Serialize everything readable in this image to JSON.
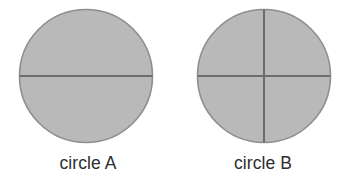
{
  "figure": {
    "name": "two-shaded-circles-partitioned",
    "background_color": "#ffffff",
    "width": 351,
    "height": 185
  },
  "colors": {
    "circle_fill": "#b9b9b9",
    "circle_stroke": "#8e8e8e",
    "divider_line": "#6d6d6d",
    "label_text": "#2e2e2e"
  },
  "shapes": [
    {
      "id": "circle-a",
      "label": "circle A",
      "center_x": 86,
      "center_y": 76,
      "radius": 67,
      "fill": "#b9b9b9",
      "stroke": "#8e8e8e",
      "partitions": 2,
      "dividers": [
        "horizontal"
      ],
      "shaded_parts": 2
    },
    {
      "id": "circle-b",
      "label": "circle B",
      "center_x": 264,
      "center_y": 76,
      "radius": 67,
      "fill": "#b9b9b9",
      "stroke": "#8e8e8e",
      "partitions": 4,
      "dividers": [
        "horizontal",
        "vertical"
      ],
      "shaded_parts": 4
    }
  ],
  "labels": {
    "circle_a": "circle A",
    "circle_b": "circle B"
  }
}
